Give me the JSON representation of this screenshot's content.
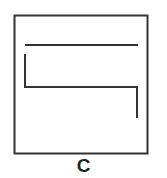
{
  "figure": {
    "label": "C",
    "box": {
      "x": 14,
      "y": 15,
      "width": 134,
      "height": 139
    },
    "stroke_color": "#333333",
    "paths": [
      {
        "name": "top-line",
        "points": [
          [
            25,
            45
          ],
          [
            138,
            45
          ]
        ]
      },
      {
        "name": "zigzag-line",
        "points": [
          [
            25,
            54
          ],
          [
            25,
            87
          ],
          [
            137,
            87
          ],
          [
            137,
            118
          ]
        ]
      }
    ]
  }
}
